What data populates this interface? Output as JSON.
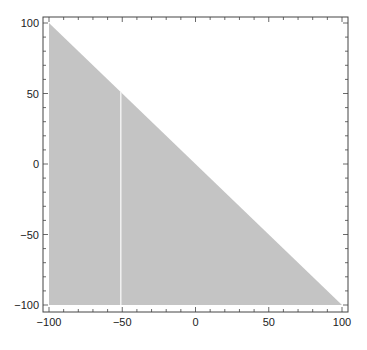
{
  "chart_data": {
    "type": "area",
    "title": "",
    "xlabel": "",
    "ylabel": "",
    "xlim": [
      -100,
      100
    ],
    "ylim": [
      -100,
      100
    ],
    "grid": false,
    "legend": null,
    "region": {
      "description": "Filled triangle: x >= -100, y >= -100, y <= -x",
      "vertices": [
        [
          -100,
          100
        ],
        [
          100,
          -100
        ],
        [
          -100,
          -100
        ]
      ],
      "fill": "#c4c4c4"
    },
    "annotations": [
      {
        "type": "vertical-line",
        "x": -51,
        "y_from": -100,
        "y_to": 51,
        "color": "#f2f2f2"
      }
    ],
    "x_ticks": [
      -100,
      -50,
      0,
      50,
      100
    ],
    "y_ticks": [
      100,
      50,
      0,
      -50,
      -100
    ],
    "x_tick_labels": [
      "−100",
      "−50",
      "0",
      "50",
      "100"
    ],
    "y_tick_labels": [
      "100",
      "50",
      "0",
      "−50",
      "−100"
    ]
  },
  "colors": {
    "frame": "#444444",
    "fill": "#c4c4c4",
    "line": "#f2f2f2",
    "background": "#ffffff"
  }
}
